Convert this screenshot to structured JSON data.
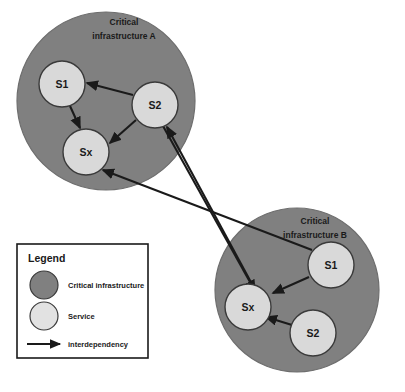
{
  "diagram": {
    "title_hidden": "",
    "colors": {
      "infrastructure_fill": "#808080",
      "infrastructure_stroke": "#5f5f5f",
      "service_fill": "#d9d9d9",
      "service_stroke": "#3a3a3a",
      "arrow": "#1a1a1a",
      "background": "#ffffff",
      "legend_border": "#1a1a1a"
    },
    "infrastructures": [
      {
        "id": "ci-a",
        "label_line1": "Critical",
        "label_line2": "infrastructure A",
        "cx": 106,
        "cy": 101,
        "r": 89,
        "services": [
          {
            "id": "a-s1",
            "label": "S1",
            "cx": 62,
            "cy": 84,
            "r": 23
          },
          {
            "id": "a-s2",
            "label": "S2",
            "cx": 155,
            "cy": 105,
            "r": 23
          },
          {
            "id": "a-sx",
            "label": "Sx",
            "cx": 86,
            "cy": 152,
            "r": 23
          }
        ]
      },
      {
        "id": "ci-b",
        "label_line1": "Critical",
        "label_line2": "infrastructure B",
        "cx": 297,
        "cy": 290,
        "r": 82,
        "services": [
          {
            "id": "b-s1",
            "label": "S1",
            "cx": 331,
            "cy": 265,
            "r": 23
          },
          {
            "id": "b-sx",
            "label": "Sx",
            "cx": 248,
            "cy": 307,
            "r": 23
          },
          {
            "id": "b-s2",
            "label": "S2",
            "cx": 313,
            "cy": 333,
            "r": 23
          }
        ]
      }
    ],
    "interdependencies": [
      {
        "id": "dep-a-s2-to-a-s1",
        "from": "a-s2",
        "to": "a-s1"
      },
      {
        "id": "dep-a-s1-to-a-sx",
        "from": "a-s1",
        "to": "a-sx"
      },
      {
        "id": "dep-a-s2-to-a-sx",
        "from": "a-s2",
        "to": "a-sx"
      },
      {
        "id": "dep-b-s1-to-b-sx",
        "from": "b-s1",
        "to": "b-sx"
      },
      {
        "id": "dep-b-s2-to-b-sx",
        "from": "b-s2",
        "to": "b-sx"
      },
      {
        "id": "dep-b-sx-to-a-s2",
        "from": "b-sx",
        "to": "a-s2"
      },
      {
        "id": "dep-a-s2-to-b-sx",
        "from": "a-s2",
        "to": "b-sx"
      },
      {
        "id": "dep-b-s1-to-a-sx",
        "from": "b-s1",
        "to": "a-sx"
      }
    ]
  },
  "legend": {
    "title": "Legend",
    "items": [
      {
        "id": "legend-infrastructure",
        "symbol": "dark-circle",
        "label": "Critical infrastructure"
      },
      {
        "id": "legend-service",
        "symbol": "light-circle",
        "label": "Service"
      },
      {
        "id": "legend-interdependency",
        "symbol": "arrow",
        "label": "interdependency"
      }
    ]
  }
}
